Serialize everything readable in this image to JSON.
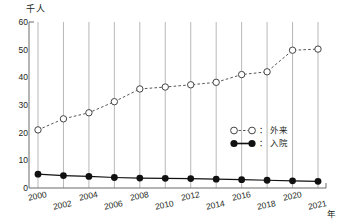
{
  "chart_data": {
    "type": "line",
    "title": "",
    "ylabel": "千人",
    "xlabel": "年",
    "ylim": [
      0,
      60
    ],
    "yticks": [
      0,
      10,
      20,
      30,
      40,
      50,
      60
    ],
    "grid": "vertical",
    "legend_position": "inside-right",
    "categories": [
      "2000",
      "2002",
      "2004",
      "2006",
      "2008",
      "2010",
      "2012",
      "2014",
      "2016",
      "2018",
      "2020",
      "2021"
    ],
    "x": [
      2000,
      2002,
      2004,
      2006,
      2008,
      2010,
      2012,
      2014,
      2016,
      2018,
      2020,
      2021
    ],
    "series": [
      {
        "name": "外来",
        "marker": "open-circle",
        "line": "dashed",
        "color": "#555555",
        "values": [
          21.0,
          25.0,
          27.2,
          31.2,
          35.8,
          36.5,
          37.3,
          38.2,
          41.0,
          42.0,
          49.8,
          50.2
        ]
      },
      {
        "name": "入院",
        "marker": "filled-circle",
        "line": "solid",
        "color": "#111111",
        "values": [
          5.0,
          4.5,
          4.2,
          3.8,
          3.6,
          3.5,
          3.4,
          3.2,
          3.0,
          2.8,
          2.6,
          2.4
        ]
      }
    ]
  },
  "axis": {
    "unit_label": "千人",
    "x_unit_label": "年",
    "ytick_labels": [
      "60",
      "50",
      "40",
      "30",
      "20",
      "10",
      "0"
    ],
    "xtick_labels": [
      "2000",
      "2002",
      "2004",
      "2006",
      "2008",
      "2010",
      "2012",
      "2014",
      "2016",
      "2018",
      "2020",
      "2021"
    ]
  },
  "legend": {
    "items": [
      {
        "label": "外来",
        "colon": "：",
        "marker": "open-circle"
      },
      {
        "label": "入院",
        "colon": "：",
        "marker": "filled-circle"
      }
    ]
  }
}
